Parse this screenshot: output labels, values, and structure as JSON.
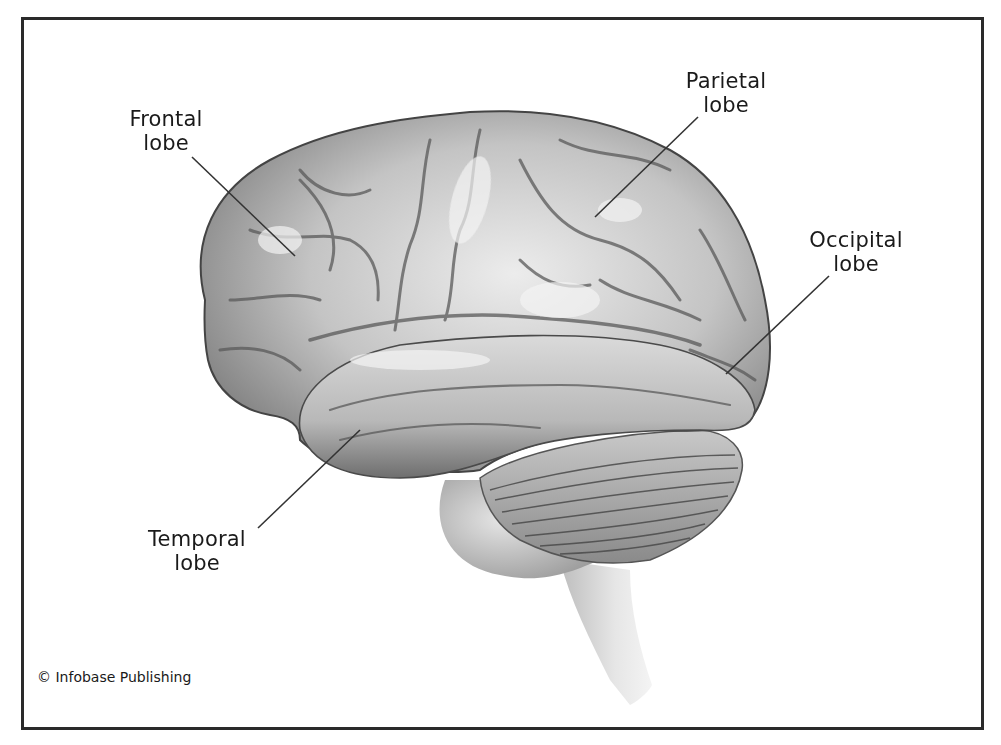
{
  "figure": {
    "labels": [
      {
        "id": "frontal",
        "line1": "Frontal",
        "line2": "lobe"
      },
      {
        "id": "parietal",
        "line1": "Parietal",
        "line2": "lobe"
      },
      {
        "id": "occipital",
        "line1": "Occipital",
        "line2": "lobe"
      },
      {
        "id": "temporal",
        "line1": "Temporal",
        "line2": "lobe"
      }
    ],
    "credit": "© Infobase Publishing"
  },
  "colors": {
    "frame": "#2a2a2a",
    "text": "#1a1a1a",
    "brain_light": "#e4e4e4",
    "brain_mid": "#a8a8a8",
    "brain_dark": "#5a5a5a",
    "leader_line": "#333333"
  }
}
